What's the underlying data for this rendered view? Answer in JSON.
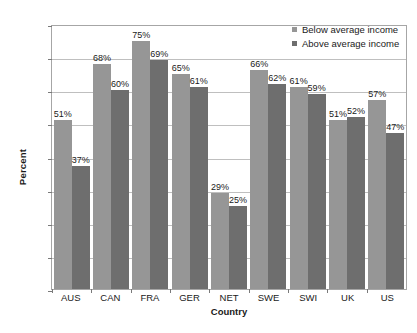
{
  "chart_data": {
    "type": "bar",
    "title": "",
    "xlabel": "Country",
    "ylabel": "Percent",
    "categories": [
      "AUS",
      "CAN",
      "FRA",
      "GER",
      "NET",
      "SWE",
      "SWI",
      "UK",
      "US"
    ],
    "series": [
      {
        "name": "Below average income",
        "color": "#969696",
        "values": [
          51,
          68,
          75,
          65,
          29,
          66,
          61,
          51,
          57
        ],
        "value_labels": [
          "51%",
          "68%",
          "75%",
          "65%",
          "29%",
          "66%",
          "61%",
          "51%",
          "57%"
        ]
      },
      {
        "name": "Above average income",
        "color": "#6e6e6e",
        "values": [
          37,
          60,
          69,
          61,
          25,
          62,
          59,
          52,
          47
        ],
        "value_labels": [
          "37%",
          "60%",
          "69%",
          "61%",
          "25%",
          "62%",
          "59%",
          "52%",
          "47%"
        ]
      }
    ],
    "ylim": [
      0,
      80
    ],
    "ytick_values": [
      0,
      10,
      20,
      30,
      40,
      50,
      60,
      70,
      80
    ],
    "ytick_labels": [
      "0%",
      "10%",
      "20%",
      "30%",
      "40%",
      "50%",
      "60%",
      "70%",
      "80%"
    ],
    "grid": true,
    "legend_position": "top-right",
    "plot_border_color": "#a6a6a6",
    "gridline_color": "#bfbfbf",
    "background": "#ffffff"
  }
}
